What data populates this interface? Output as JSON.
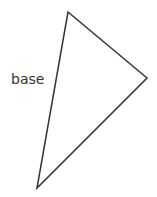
{
  "diagram": {
    "type": "triangle",
    "vertices": {
      "top": [
        68,
        12
      ],
      "right": [
        147,
        78
      ],
      "bottom": [
        37,
        188
      ]
    },
    "stroke_color": "#333333",
    "labels": {
      "side_label": "base"
    }
  }
}
